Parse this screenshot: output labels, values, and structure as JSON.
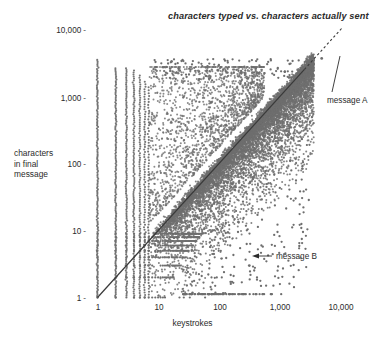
{
  "chart_data": {
    "type": "scatter",
    "title": "characters typed vs. characters actually sent",
    "xlabel": "keystrokes",
    "ylabel": "characters in final message",
    "ylabel_lines": [
      "characters",
      "in final",
      "message"
    ],
    "xscale": "log",
    "yscale": "log",
    "xlim": [
      1,
      20000
    ],
    "ylim": [
      1,
      20000
    ],
    "xticks": [
      1,
      10,
      100,
      1000,
      10000
    ],
    "xtick_labels": [
      "1",
      "10",
      "100",
      "1,000",
      "10,000"
    ],
    "yticks": [
      1,
      10,
      100,
      1000,
      10000
    ],
    "ytick_labels": [
      "1",
      "10",
      "100",
      "1,000",
      "10,000"
    ],
    "grid": false,
    "legend": null,
    "marker_color": "#6e6e6e",
    "reference_line": {
      "label": "y = x",
      "style": "dashed-to-solid",
      "from": [
        1,
        1
      ],
      "to": [
        6000,
        6000
      ],
      "color": "#3a3a3a"
    },
    "annotations": [
      {
        "text": "message A",
        "point": [
          5000,
          3800
        ],
        "label_at": [
          6200,
          900
        ],
        "connector": "line"
      },
      {
        "text": "message B",
        "point": [
          320,
          3
        ],
        "label_at": [
          900,
          3
        ],
        "connector": "arrow-left"
      }
    ],
    "series": [
      {
        "name": "messages",
        "n_points_approx": 50000,
        "x": [
          1,
          1,
          1,
          1,
          1,
          1,
          1,
          1,
          1,
          1,
          2,
          2,
          2,
          2,
          2,
          2,
          2,
          3,
          3,
          3,
          3,
          3,
          4,
          4,
          4,
          4,
          5,
          5,
          5,
          6,
          6,
          7,
          7,
          8,
          9,
          10,
          12,
          15,
          18,
          20,
          25,
          30,
          40,
          50,
          60,
          80,
          100,
          120,
          150,
          200,
          250,
          300,
          400,
          500,
          600,
          800,
          1000,
          1200,
          1500,
          2000,
          2500,
          3000,
          3500,
          4000,
          5000
        ],
        "y": [
          1,
          2,
          3,
          4,
          6,
          10,
          20,
          80,
          400,
          3000,
          1,
          2,
          4,
          8,
          30,
          200,
          2500,
          1,
          3,
          7,
          60,
          2600,
          1,
          2,
          5,
          2400,
          2,
          6,
          2000,
          3,
          1500,
          4,
          1200,
          8,
          9,
          10,
          12,
          14,
          17,
          19,
          24,
          28,
          38,
          47,
          55,
          75,
          95,
          110,
          140,
          190,
          240,
          280,
          380,
          470,
          560,
          760,
          950,
          1150,
          1400,
          1900,
          2300,
          2700,
          2900,
          3100,
          3800
        ]
      }
    ]
  },
  "annotations": {
    "message_a": "message A",
    "message_b": "message B"
  }
}
